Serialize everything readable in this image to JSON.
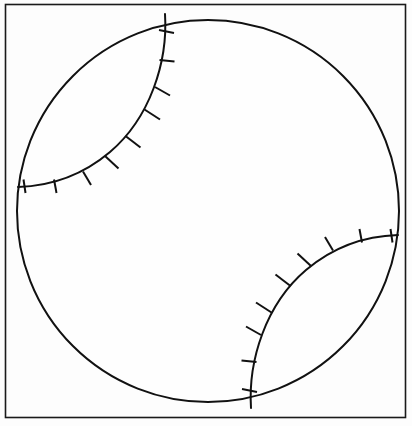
{
  "figure": {
    "width": 412,
    "height": 426,
    "background_color": "#fdfdfd",
    "line_color": "#111111"
  },
  "frame": {
    "name": "border-frame",
    "x": 5.5,
    "y": 4.5,
    "width": 400,
    "height": 413,
    "stroke_color": "#1a1a1a",
    "stroke_width": 1.6,
    "fill_color": "#fdfdfd"
  },
  "ball": {
    "name": "baseball-outline",
    "center_x": 208,
    "center_y": 211,
    "radius": 191,
    "stroke_color": "#111111",
    "stroke_width": 2.0,
    "fill_color": "#fefefe"
  },
  "seams": [
    {
      "id": "seam-upper-left",
      "label": "Upper left seam",
      "path": "M 165 14 C 168 62 150 118 110 152 C 84 174 52 186 18 187",
      "stroke_width": 2.0,
      "stitches": [
        {
          "x1": 159.0,
          "y1": 30.0,
          "x2": 174.0,
          "y2": 33.0
        },
        {
          "x1": 159.5,
          "y1": 60.0,
          "x2": 174.5,
          "y2": 61.5
        },
        {
          "x1": 155.0,
          "y1": 87.0,
          "x2": 170.0,
          "y2": 95.5
        },
        {
          "x1": 144.5,
          "y1": 109.5,
          "x2": 160.0,
          "y2": 119.5
        },
        {
          "x1": 125.5,
          "y1": 136.0,
          "x2": 140.5,
          "y2": 147.5
        },
        {
          "x1": 105.0,
          "y1": 156.0,
          "x2": 118.5,
          "y2": 168.5
        },
        {
          "x1": 83.0,
          "y1": 171.5,
          "x2": 91.0,
          "y2": 185.0
        },
        {
          "x1": 54.0,
          "y1": 179.5,
          "x2": 56.5,
          "y2": 193.0
        },
        {
          "x1": 23.5,
          "y1": 179.5,
          "x2": 25.5,
          "y2": 193.0
        }
      ]
    },
    {
      "id": "seam-lower-right",
      "label": "Lower right seam",
      "path": "M 251 408 C 248 360 266 304 306 270 C 332 248 364 236 398 235",
      "stroke_width": 2.0,
      "stitches": [
        {
          "x1": 257.0,
          "y1": 392.0,
          "x2": 242.0,
          "y2": 389.0
        },
        {
          "x1": 256.5,
          "y1": 362.0,
          "x2": 241.5,
          "y2": 360.5
        },
        {
          "x1": 261.0,
          "y1": 335.0,
          "x2": 246.0,
          "y2": 326.5
        },
        {
          "x1": 271.5,
          "y1": 312.5,
          "x2": 256.0,
          "y2": 302.5
        },
        {
          "x1": 290.5,
          "y1": 286.0,
          "x2": 275.5,
          "y2": 274.5
        },
        {
          "x1": 311.0,
          "y1": 266.0,
          "x2": 297.5,
          "y2": 253.5
        },
        {
          "x1": 333.0,
          "y1": 250.5,
          "x2": 325.0,
          "y2": 237.0
        },
        {
          "x1": 362.0,
          "y1": 242.5,
          "x2": 359.5,
          "y2": 229.0
        },
        {
          "x1": 392.5,
          "y1": 242.5,
          "x2": 390.5,
          "y2": 229.0
        }
      ]
    }
  ],
  "chart_data": {
    "type": "line",
    "xlabel": "",
    "ylabel": "",
    "xlim": [
      0,
      412
    ],
    "ylim": [
      0,
      426
    ],
    "grid": false,
    "legend": "none",
    "annotations": [],
    "series": [
      {
        "name": "border frame",
        "shape": "rectangle",
        "values": [
          5.5,
          4.5,
          400,
          413
        ]
      },
      {
        "name": "ball circle",
        "shape": "circle",
        "values": [
          208,
          211,
          191
        ]
      },
      {
        "name": "upper left seam",
        "shape": "arc",
        "stitch_count": 9
      },
      {
        "name": "lower right seam",
        "shape": "arc",
        "stitch_count": 9
      }
    ]
  }
}
